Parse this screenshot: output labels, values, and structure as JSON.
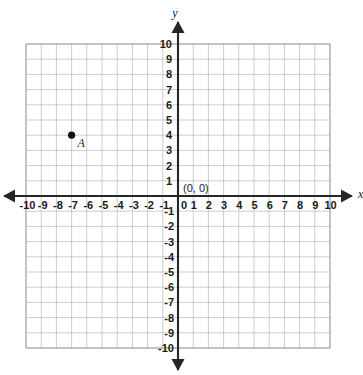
{
  "figure": {
    "kind": "coordinate-plane",
    "background_color": "#ffffff",
    "grid_color": "#b9b9b9",
    "axis_color": "#262626",
    "point_color": "#111111"
  },
  "axes": {
    "x_axis_name": "x",
    "y_axis_name": "y",
    "origin_label": "(0, 0)",
    "origin_tick_label": "0",
    "x_tick_labels": [
      "-10",
      "-9",
      "-8",
      "-7",
      "-6",
      "-5",
      "-4",
      "-3",
      "-2",
      "-1",
      "1",
      "2",
      "3",
      "4",
      "5",
      "6",
      "7",
      "8",
      "9",
      "10"
    ],
    "y_tick_labels_positive": [
      "1",
      "2",
      "3",
      "4",
      "5",
      "6",
      "7",
      "8",
      "9",
      "10"
    ],
    "y_tick_labels_negative": [
      "-1",
      "-2",
      "-3",
      "-4",
      "-5",
      "-6",
      "-7",
      "-8",
      "-9",
      "-10"
    ]
  },
  "chart_data": {
    "type": "scatter",
    "title": "",
    "subtitle": "",
    "xlabel": "x",
    "ylabel": "y",
    "xlim": [
      -10,
      10
    ],
    "ylim": [
      -10,
      10
    ],
    "xticks": [
      -10,
      -9,
      -8,
      -7,
      -6,
      -5,
      -4,
      -3,
      -2,
      -1,
      0,
      1,
      2,
      3,
      4,
      5,
      6,
      7,
      8,
      9,
      10
    ],
    "yticks": [
      -10,
      -9,
      -8,
      -7,
      -6,
      -5,
      -4,
      -3,
      -2,
      -1,
      0,
      1,
      2,
      3,
      4,
      5,
      6,
      7,
      8,
      9,
      10
    ],
    "grid": true,
    "legend": false,
    "annotations": [
      {
        "text": "(0, 0)",
        "x": 0,
        "y": 0
      }
    ],
    "series": [
      {
        "name": "A",
        "points": [
          {
            "label": "A",
            "x": -7,
            "y": 4
          }
        ]
      }
    ]
  }
}
